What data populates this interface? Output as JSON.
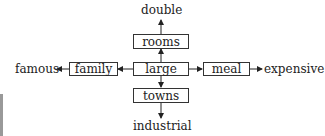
{
  "diagram": {
    "center": {
      "label": "large"
    },
    "nodes": {
      "up": {
        "label": "rooms"
      },
      "down": {
        "label": "towns"
      },
      "left": {
        "label": "family"
      },
      "right": {
        "label": "meal"
      }
    },
    "outer": {
      "up": "double",
      "down": "industrial",
      "left": "famous",
      "right": "expensive"
    },
    "edges": [
      [
        "large",
        "rooms"
      ],
      [
        "rooms",
        "double"
      ],
      [
        "large",
        "towns"
      ],
      [
        "towns",
        "industrial"
      ],
      [
        "large",
        "family"
      ],
      [
        "family",
        "famous"
      ],
      [
        "large",
        "meal"
      ],
      [
        "meal",
        "expensive"
      ]
    ]
  }
}
